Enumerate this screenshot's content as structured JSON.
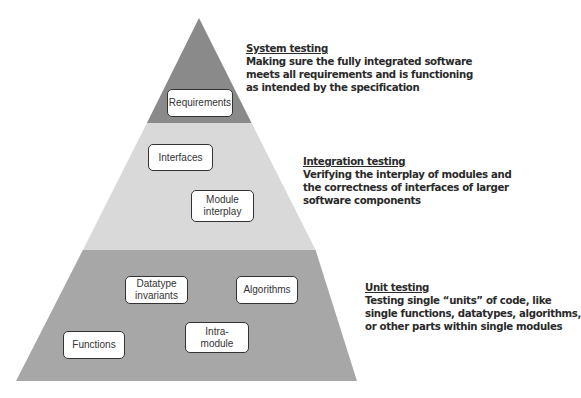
{
  "colors": {
    "system_band": "#8a8a8a",
    "integration_band": "#d9d9d9",
    "unit_band": "#a7a7a7"
  },
  "levels": [
    {
      "id": "system",
      "title": "System testing",
      "description_lines": [
        "Making sure the fully integrated software",
        "meets all requirements and is functioning",
        "as intended by the specification"
      ],
      "boxes": [
        "Requirements"
      ]
    },
    {
      "id": "integration",
      "title": "Integration testing",
      "description_lines": [
        "Verifying the interplay of modules and",
        "the correctness of interfaces of larger",
        "software components"
      ],
      "boxes": [
        "Interfaces",
        "Module\ninterplay"
      ]
    },
    {
      "id": "unit",
      "title": "Unit testing",
      "description_lines": [
        "Testing single “units” of code, like",
        "single functions, datatypes, algorithms,",
        "or other parts within single modules"
      ],
      "boxes": [
        "Datatype\ninvariants",
        "Algorithms",
        "Functions",
        "Intra-\nmodule"
      ]
    }
  ]
}
